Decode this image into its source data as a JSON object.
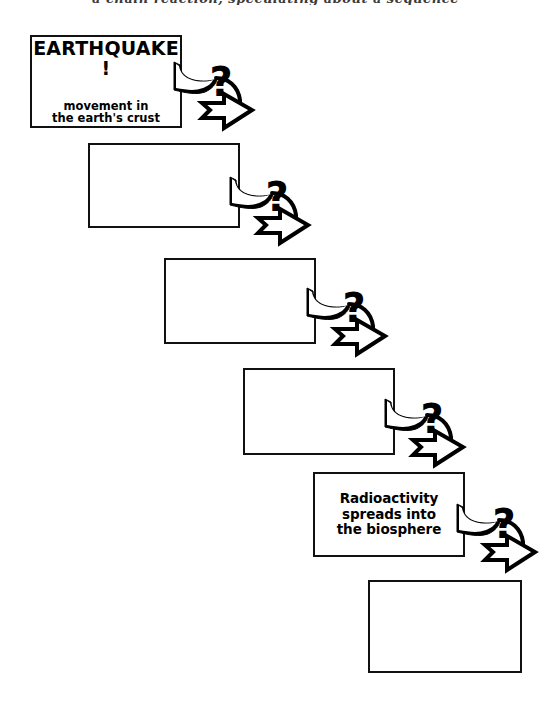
{
  "page": {
    "title_partial": "a chain reaction, speculating about a sequence",
    "background_color": "#ffffff",
    "ink_color": "#000000",
    "width": 551,
    "height": 709
  },
  "diagram": {
    "type": "cascading-flowchart",
    "orientation": "descending-diagonal",
    "box_count": 6,
    "connector_count": 5,
    "connector_icon": "question-arrow-icon",
    "boxes": [
      {
        "index": 1,
        "name": "box-earthquake",
        "filled": true,
        "headline": "EARTHQUAKE !",
        "subtext": "movement in\nthe earth's  crust",
        "x": 30,
        "y": 35,
        "w": 152,
        "h": 93
      },
      {
        "index": 2,
        "name": "box-blank-2",
        "filled": false,
        "text": "",
        "x": 88,
        "y": 143,
        "w": 152,
        "h": 85
      },
      {
        "index": 3,
        "name": "box-blank-3",
        "filled": false,
        "text": "",
        "x": 164,
        "y": 258,
        "w": 152,
        "h": 86
      },
      {
        "index": 4,
        "name": "box-blank-4",
        "filled": false,
        "text": "",
        "x": 243,
        "y": 368,
        "w": 152,
        "h": 87
      },
      {
        "index": 5,
        "name": "box-radioactivity",
        "filled": true,
        "text": "Radioactivity\nspreads into\nthe biosphere",
        "x": 313,
        "y": 472,
        "w": 152,
        "h": 85
      },
      {
        "index": 6,
        "name": "box-blank-6",
        "filled": false,
        "text": "",
        "x": 368,
        "y": 580,
        "w": 154,
        "h": 93
      }
    ],
    "connectors": [
      {
        "index": 1,
        "name": "connector-1",
        "label": "?",
        "from_box": 1,
        "to_box": 2,
        "x": 172,
        "y": 48
      },
      {
        "index": 2,
        "name": "connector-2",
        "label": "?",
        "from_box": 2,
        "to_box": 3,
        "x": 228,
        "y": 163
      },
      {
        "index": 3,
        "name": "connector-3",
        "label": "?",
        "from_box": 3,
        "to_box": 4,
        "x": 305,
        "y": 274
      },
      {
        "index": 4,
        "name": "connector-4",
        "label": "?",
        "from_box": 4,
        "to_box": 5,
        "x": 383,
        "y": 385
      },
      {
        "index": 5,
        "name": "connector-5",
        "label": "?",
        "from_box": 5,
        "to_box": 6,
        "x": 455,
        "y": 490
      }
    ]
  }
}
